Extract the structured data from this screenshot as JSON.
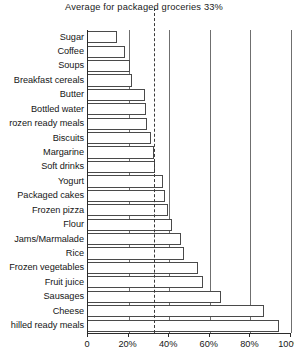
{
  "annotation": {
    "average_caption": "Average for packaged groceries 33%",
    "average_value": 33
  },
  "axis": {
    "tick_labels": [
      "0",
      "20%",
      "40%",
      "60%",
      "80%",
      "100%"
    ],
    "tick_values": [
      0,
      20,
      40,
      60,
      80,
      100
    ]
  },
  "chart_data": {
    "type": "bar",
    "orientation": "horizontal",
    "title": "Average for packaged groceries 33%",
    "xlabel": "",
    "ylabel": "",
    "xlim": [
      0,
      100
    ],
    "grid": true,
    "legend": "none",
    "annotations": [
      {
        "label": "Average for packaged groceries 33%",
        "value": 33,
        "style": "vertical dashed line"
      }
    ],
    "xtick_labels": [
      "0",
      "20%",
      "40%",
      "60%",
      "80%",
      "100%"
    ],
    "categories": [
      "Sugar",
      "Coffee",
      "Soups",
      "Breakfast cereals",
      "Butter",
      "Bottled water",
      "Frozen ready meals",
      "Biscuits",
      "Margarine",
      "Soft drinks",
      "Yogurt",
      "Packaged cakes",
      "Frozen pizza",
      "Flour",
      "Jams/Marmalade",
      "Rice",
      "Frozen vegetables",
      "Fruit juice",
      "Sausages",
      "Cheese",
      "Chilled ready meals"
    ],
    "values": [
      14.5,
      18,
      20.5,
      21.5,
      28,
      28.5,
      29,
      31,
      32.5,
      33,
      37,
      38,
      39.5,
      41.5,
      46,
      47.5,
      54,
      56.5,
      65.5,
      86.5,
      94
    ]
  },
  "labels_displayed": [
    "Sugar",
    "Coffee",
    "Soups",
    "Breakfast cereals",
    "Butter",
    "Bottled water",
    "rozen ready meals",
    "Biscuits",
    "Margarine",
    "Soft drinks",
    "Yogurt",
    "Packaged cakes",
    "Frozen pizza",
    "Flour",
    "Jams/Marmalade",
    "Rice",
    "Frozen vegetables",
    "Fruit juice",
    "Sausages",
    "Cheese",
    "hilled ready meals"
  ],
  "colors": {
    "bar_fill": "#ffffff",
    "bar_stroke": "#4a4a4a",
    "gridline": "#6f6f6f",
    "axis": "#2b2b2b",
    "text": "#161616"
  }
}
